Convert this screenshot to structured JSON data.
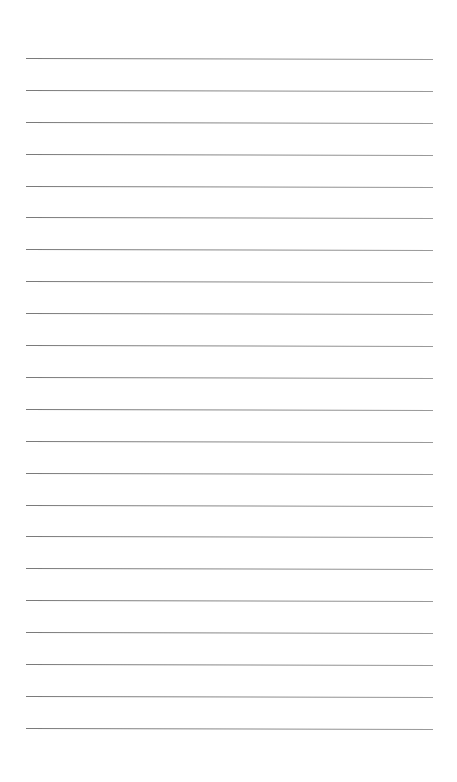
{
  "page": {
    "type": "lined-paper",
    "background": "#ffffff",
    "line_color": "#888888",
    "line_count": 22,
    "first_line_y": 58,
    "line_spacing": 31.9,
    "line_left": 26,
    "line_right": 433,
    "lines": [
      {
        "y": 58
      },
      {
        "y": 90
      },
      {
        "y": 122
      },
      {
        "y": 154
      },
      {
        "y": 186
      },
      {
        "y": 217
      },
      {
        "y": 249
      },
      {
        "y": 281
      },
      {
        "y": 313
      },
      {
        "y": 345
      },
      {
        "y": 377
      },
      {
        "y": 409
      },
      {
        "y": 441
      },
      {
        "y": 473
      },
      {
        "y": 505
      },
      {
        "y": 536
      },
      {
        "y": 568
      },
      {
        "y": 600
      },
      {
        "y": 632
      },
      {
        "y": 664
      },
      {
        "y": 696
      },
      {
        "y": 728
      }
    ]
  }
}
